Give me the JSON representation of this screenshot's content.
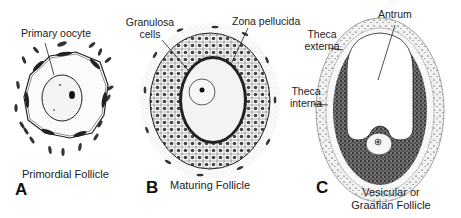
{
  "figure": {
    "panels": [
      {
        "letter": "A",
        "caption": "Primordial Follicle",
        "labels": [
          "Primary oocyte"
        ]
      },
      {
        "letter": "B",
        "caption": "Maturing Follicle",
        "labels": [
          "Granulosa cells",
          "Zona pellucida"
        ]
      },
      {
        "letter": "C",
        "caption_line1": "Vesicular or",
        "caption_line2": "Graafian Follicle",
        "labels": [
          "Antrum",
          "Theca externa",
          "Theca interna"
        ]
      }
    ]
  },
  "labels": {
    "primary_oocyte": "Primary oocyte",
    "granulosa_line1": "Granulosa",
    "granulosa_line2": "cells",
    "zona_pellucida": "Zona pellucida",
    "antrum": "Antrum",
    "theca_externa_line1": "Theca",
    "theca_externa_line2": "externa",
    "theca_interna_line1": "Theca",
    "theca_interna_line2": "interna"
  },
  "captions": {
    "a_letter": "A",
    "a_caption": "Primordial Follicle",
    "b_letter": "B",
    "b_caption": "Maturing Follicle",
    "c_letter": "C",
    "c_caption_line1": "Vesicular or",
    "c_caption_line2": "Graafian Follicle"
  }
}
